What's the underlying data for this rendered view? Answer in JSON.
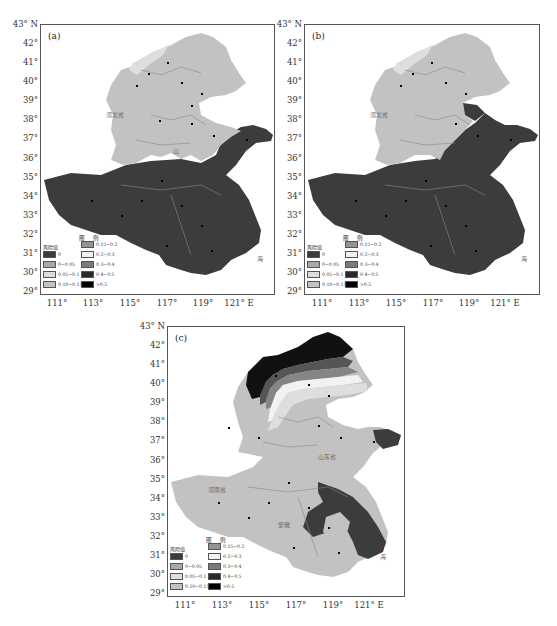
{
  "figure": {
    "panels": [
      {
        "id": "a",
        "label": "(a)"
      },
      {
        "id": "b",
        "label": "(b)"
      },
      {
        "id": "c",
        "label": "(c)"
      }
    ],
    "y_axis": {
      "ticks": [
        "43° N",
        "42°",
        "41°",
        "40°",
        "39°",
        "38°",
        "37°",
        "36°",
        "35°",
        "34°",
        "33°",
        "32°",
        "31°",
        "30°",
        "29°"
      ]
    },
    "x_axis": {
      "ticks": [
        "111°",
        "113°",
        "115°",
        "117°",
        "119°",
        "121° E"
      ]
    },
    "legend": {
      "title": "图 例",
      "header": "风险值",
      "items": [
        {
          "label": "0",
          "color": "#3c3c3c"
        },
        {
          "label": "0~0.05",
          "color": "#a9a9a9"
        },
        {
          "label": "0.05~0.1",
          "color": "#dedede"
        },
        {
          "label": "0.10~0.15",
          "color": "#c2c2c2"
        },
        {
          "label": "0.15~0.2",
          "color": "#939393"
        },
        {
          "label": "0.2~0.3",
          "color": "#f2f2f2"
        },
        {
          "label": "0.3~0.4",
          "color": "#7a7a7a"
        },
        {
          "label": "0.4~0.5",
          "color": "#2a2a2a"
        },
        {
          "label": ">0.5",
          "color": "#000000"
        }
      ]
    },
    "map_labels": {
      "provinces": [
        "河北省",
        "山东省",
        "河南省",
        "安徽",
        "江苏"
      ],
      "cities": [
        "张北",
        "张家口",
        "丰宁",
        "围场",
        "承德",
        "怀来",
        "蔚县",
        "遵化",
        "唐山",
        "秦皇岛",
        "保定",
        "廊坊",
        "天津",
        "石家庄",
        "饶阳",
        "沧州",
        "邢台",
        "南宫",
        "德州",
        "惠民",
        "潍坊",
        "烟台",
        "威海",
        "济南",
        "泰山",
        "沂源",
        "青岛",
        "日照",
        "郑州",
        "开封",
        "商丘",
        "徐州",
        "许昌",
        "阜阳",
        "蚌埠",
        "南京",
        "合肥",
        "安庆",
        "屯溪",
        "南阳",
        "驻马店",
        "信阳",
        "卢氏",
        "三门峡",
        "吕泗"
      ],
      "sea": "海"
    }
  }
}
